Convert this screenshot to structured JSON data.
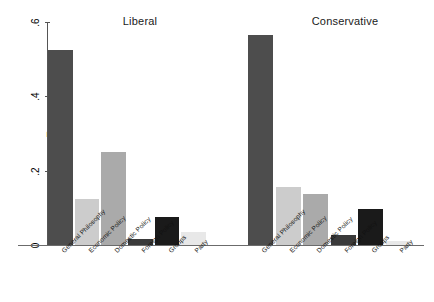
{
  "chart_data": {
    "type": "bar",
    "title": "",
    "xlabel": "",
    "ylabel": "Frequency",
    "ylim": [
      0,
      0.6
    ],
    "yticks": [
      "0",
      ".2",
      ".4",
      ".6"
    ],
    "ytick_values": [
      0,
      0.2,
      0.4,
      0.6
    ],
    "grid": false,
    "legend": "none",
    "panels": [
      "Liberal",
      "Conservative"
    ],
    "categories": [
      "General Philosophy",
      "Economic Policy",
      "Domestic Policy",
      "Foreign Policy",
      "Groups",
      "Party"
    ],
    "series": [
      {
        "name": "Liberal",
        "values": [
          0.525,
          0.125,
          0.25,
          0.015,
          0.075,
          0.035
        ]
      },
      {
        "name": "Conservative",
        "values": [
          0.565,
          0.155,
          0.137,
          0.028,
          0.097,
          0.012
        ]
      }
    ],
    "category_colors": [
      "#4d4d4d",
      "#cccccc",
      "#aaaaaa",
      "#3a3a3a",
      "#1a1a1a",
      "#e8e8e8"
    ]
  },
  "axes": {
    "y_label": "Frequency"
  },
  "panel_titles": {
    "liberal": "Liberal",
    "conservative": "Conservative"
  }
}
